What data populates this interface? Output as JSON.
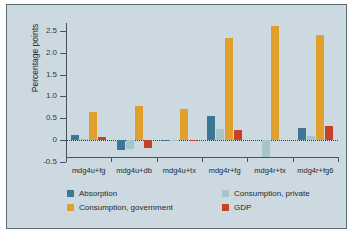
{
  "chart_data": {
    "type": "bar",
    "title": "",
    "subtitle": "",
    "xlabel": "",
    "ylabel": "Percentage points",
    "ylim": [
      -0.5,
      2.85
    ],
    "yticks": [
      "2.5",
      "2.0",
      "1.5",
      "1.0",
      "0.5",
      "0",
      "-0.5"
    ],
    "ytick_values": [
      2.5,
      2.0,
      1.5,
      1.0,
      0.5,
      0,
      -0.5
    ],
    "grid": false,
    "zero_line": true,
    "legend_position": "bottom",
    "categories": [
      "mdg4u+fg",
      "mdg4u+db",
      "mdg4u+tx",
      "mdg4r+fg",
      "mdg4r+tx",
      "mdg4r+fg6"
    ],
    "series": [
      {
        "name": "Absorption",
        "color": "#3d7795",
        "values": [
          0.12,
          -0.22,
          -0.03,
          0.55,
          0.0,
          0.28
        ]
      },
      {
        "name": "Consumption, private",
        "color": "#a8c4cb",
        "values": [
          0.02,
          -0.2,
          -0.02,
          0.25,
          -0.4,
          0.1
        ]
      },
      {
        "name": "Consumption, government",
        "color": "#e1a02c",
        "values": [
          0.65,
          0.78,
          0.71,
          2.33,
          2.62,
          2.41
        ]
      },
      {
        "name": "GDP",
        "color": "#c9402a",
        "values": [
          0.06,
          -0.19,
          0.01,
          0.22,
          0.0,
          0.31
        ]
      }
    ]
  },
  "colors": {
    "panel_background": "#ccd9e0",
    "panel_border": "#5b6b73",
    "axis": "#46535c",
    "text": "#1d2a31",
    "absorption": "#3d7795",
    "consumption_private": "#a8c4cb",
    "consumption_government": "#e1a02c",
    "gdp": "#c9402a"
  },
  "legend": {
    "items": [
      {
        "label": "Absorption",
        "color": "#3d7795"
      },
      {
        "label": "Consumption, private",
        "color": "#a8c4cb"
      },
      {
        "label": "Consumption, government",
        "color": "#e1a02c"
      },
      {
        "label": "GDP",
        "color": "#c9402a"
      }
    ]
  }
}
